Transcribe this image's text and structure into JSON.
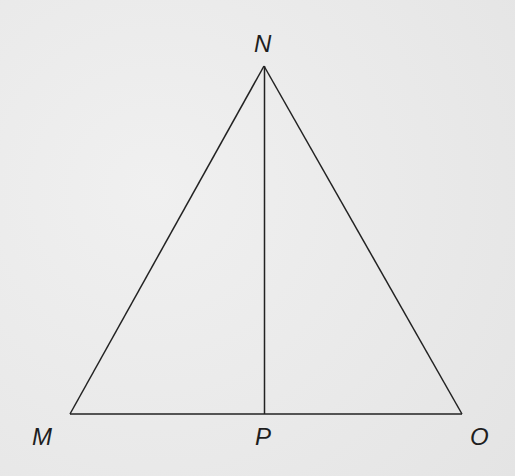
{
  "diagram": {
    "type": "triangle-with-altitude",
    "vertices": {
      "N": {
        "label": "N",
        "x": 264,
        "y": 66
      },
      "M": {
        "label": "M",
        "x": 70,
        "y": 414
      },
      "O": {
        "label": "O",
        "x": 462,
        "y": 414
      },
      "P": {
        "label": "P",
        "x": 265,
        "y": 414
      }
    },
    "segments": [
      "MN",
      "NO",
      "MO",
      "NP"
    ],
    "line_color": "#222222",
    "background_color": "#ececec"
  },
  "labels": {
    "n": "N",
    "m": "M",
    "p": "P",
    "o": "O"
  }
}
